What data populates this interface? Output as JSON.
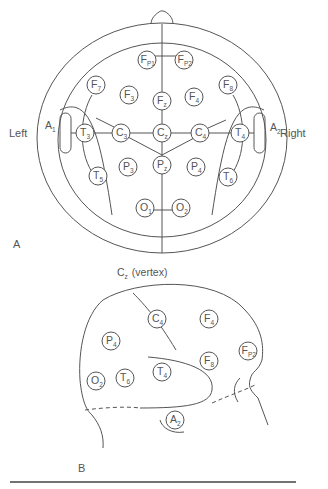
{
  "figure": {
    "panel_a": {
      "label": "A",
      "side_left": "Left",
      "side_right": "Right",
      "ear_left": {
        "main": "A",
        "sub": "1"
      },
      "ear_right": {
        "main": "A",
        "sub": "2"
      },
      "electrodes": [
        {
          "id": "fp1",
          "main": "F",
          "sub": "P1",
          "x": 147,
          "y": 60
        },
        {
          "id": "fp2",
          "main": "F",
          "sub": "P2",
          "x": 184,
          "y": 60
        },
        {
          "id": "f7",
          "main": "F",
          "sub": "7",
          "x": 96,
          "y": 85
        },
        {
          "id": "f8",
          "main": "F",
          "sub": "8",
          "x": 228,
          "y": 85
        },
        {
          "id": "f3",
          "main": "F",
          "sub": "3",
          "x": 129,
          "y": 95
        },
        {
          "id": "fz",
          "main": "F",
          "sub": "z",
          "x": 162,
          "y": 101
        },
        {
          "id": "f4",
          "main": "F",
          "sub": "4",
          "x": 194,
          "y": 97
        },
        {
          "id": "t3",
          "main": "T",
          "sub": "3",
          "x": 85,
          "y": 133
        },
        {
          "id": "c3",
          "main": "C",
          "sub": "3",
          "x": 121,
          "y": 133
        },
        {
          "id": "cz",
          "main": "C",
          "sub": "z",
          "x": 162,
          "y": 133
        },
        {
          "id": "c4",
          "main": "C",
          "sub": "4",
          "x": 200,
          "y": 133
        },
        {
          "id": "t4",
          "main": "T",
          "sub": "4",
          "x": 240,
          "y": 133
        },
        {
          "id": "p3",
          "main": "P",
          "sub": "3",
          "x": 128,
          "y": 167
        },
        {
          "id": "pz",
          "main": "P",
          "sub": "z",
          "x": 162,
          "y": 165
        },
        {
          "id": "p4",
          "main": "P",
          "sub": "4",
          "x": 196,
          "y": 167
        },
        {
          "id": "t5",
          "main": "T",
          "sub": "5",
          "x": 98,
          "y": 176
        },
        {
          "id": "t6",
          "main": "T",
          "sub": "6",
          "x": 228,
          "y": 177
        },
        {
          "id": "o1",
          "main": "O",
          "sub": "1",
          "x": 145,
          "y": 208
        },
        {
          "id": "o2",
          "main": "O",
          "sub": "2",
          "x": 181,
          "y": 208
        }
      ]
    },
    "panel_b": {
      "label": "B",
      "vertex_label": {
        "main": "C",
        "sub": "z",
        "suffix": "(vertex)"
      },
      "electrodes": [
        {
          "id": "c4",
          "main": "C",
          "sub": "4",
          "x": 157,
          "y": 319
        },
        {
          "id": "f4",
          "main": "F",
          "sub": "4",
          "x": 209,
          "y": 319
        },
        {
          "id": "p4",
          "main": "P",
          "sub": "4",
          "x": 111,
          "y": 341
        },
        {
          "id": "f8",
          "main": "F",
          "sub": "8",
          "x": 209,
          "y": 361
        },
        {
          "id": "fp2",
          "main": "F",
          "sub": "P2",
          "x": 248,
          "y": 351
        },
        {
          "id": "t4",
          "main": "T",
          "sub": "4",
          "x": 162,
          "y": 372
        },
        {
          "id": "o2",
          "main": "O",
          "sub": "2",
          "x": 96,
          "y": 381
        },
        {
          "id": "t6",
          "main": "T",
          "sub": "6",
          "x": 125,
          "y": 378
        },
        {
          "id": "a2",
          "main": "A",
          "sub": "2",
          "x": 175,
          "y": 420
        }
      ]
    },
    "colors": {
      "line": "#555555",
      "rule": "#444444",
      "background": "#ffffff"
    }
  }
}
